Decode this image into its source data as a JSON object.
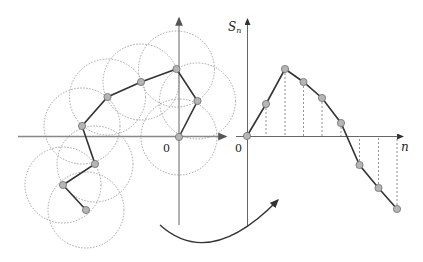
{
  "diagram": {
    "left_figure": {
      "origin_label": "0",
      "origin": [
        179,
        137
      ],
      "circle_radius": 38,
      "walk_points": [
        [
          179,
          137
        ],
        [
          197.5,
          101
        ],
        [
          176.5,
          69
        ],
        [
          141,
          82
        ],
        [
          107.5,
          97
        ],
        [
          82,
          126
        ],
        [
          95,
          164
        ],
        [
          63,
          185
        ],
        [
          86,
          210
        ]
      ]
    },
    "right_figure": {
      "y_axis_label": "S",
      "y_axis_subscript": "n",
      "x_axis_label": "n",
      "origin_label": "0",
      "origin": [
        247,
        136
      ],
      "walk_points": [
        [
          247,
          136
        ],
        [
          266,
          104
        ],
        [
          285,
          69
        ],
        [
          303.5,
          82
        ],
        [
          322,
          98
        ],
        [
          341,
          123
        ],
        [
          359.5,
          165
        ],
        [
          378.5,
          188
        ],
        [
          397,
          209
        ]
      ]
    },
    "colors": {
      "axis": "#888888",
      "path": "#333333",
      "point_fill": "#b5b5b5",
      "point_stroke": "#6e6e6e",
      "circle": "#9a9a9a",
      "arrow": "#333333"
    }
  }
}
